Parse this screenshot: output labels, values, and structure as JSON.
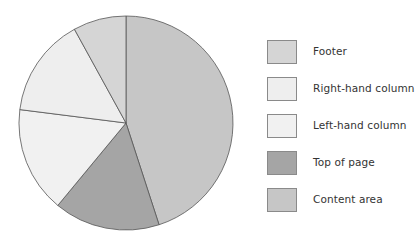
{
  "chart_data": {
    "type": "pie",
    "title": "",
    "start_angle": "12 o'clock, clockwise",
    "categories": [
      "Content area",
      "Top of page",
      "Left-hand column",
      "Right-hand column",
      "Footer"
    ],
    "values": [
      45,
      16,
      16,
      15,
      8
    ],
    "unit": "percent (estimated from slice angles)",
    "colors": [
      "#c6c6c6",
      "#a5a5a5",
      "#f1f1f1",
      "#eeeeee",
      "#d5d5d5"
    ],
    "legend_position": "right",
    "legend_order": [
      "Footer",
      "Right-hand column",
      "Left-hand column",
      "Top of page",
      "Content area"
    ]
  },
  "legend": {
    "items": [
      {
        "label": "Footer",
        "color": "#d5d5d5"
      },
      {
        "label": "Right-hand column",
        "color": "#eeeeee"
      },
      {
        "label": "Left-hand column",
        "color": "#f1f1f1"
      },
      {
        "label": "Top of page",
        "color": "#a5a5a5"
      },
      {
        "label": "Content area",
        "color": "#c6c6c6"
      }
    ]
  }
}
